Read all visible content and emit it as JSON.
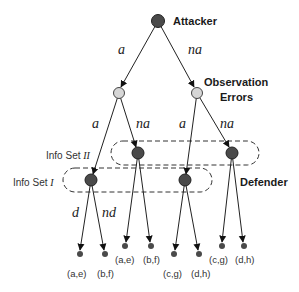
{
  "colors": {
    "player_node": "#4a4a4a",
    "chance_node": "#d6d6d6",
    "edge": "#222222",
    "text": "#1a1a1a"
  },
  "labels": {
    "attacker": "Attacker",
    "observation_errors_line1": "Observation",
    "observation_errors_line2": "Errors",
    "defender": "Defender",
    "info_set_2_prefix": "Info Set ",
    "info_set_2_roman": "II",
    "info_set_1_prefix": "Info Set ",
    "info_set_1_roman": "I"
  },
  "edges": {
    "root_left": "a",
    "root_right": "na",
    "left_chance_left": "a",
    "left_chance_right": "na",
    "right_chance_left": "a",
    "right_chance_right": "na",
    "defender_left": "d",
    "defender_right": "nd"
  },
  "nodes": {
    "root": {
      "x": 158,
      "y": 21,
      "type": "player"
    },
    "chance_left": {
      "x": 119,
      "y": 93,
      "type": "chance"
    },
    "chance_right": {
      "x": 197,
      "y": 93,
      "type": "chance"
    },
    "def_I_left": {
      "x": 91,
      "y": 180,
      "type": "player"
    },
    "def_I_right": {
      "x": 185,
      "y": 180,
      "type": "player"
    },
    "def_II_left": {
      "x": 138,
      "y": 153,
      "type": "player"
    },
    "def_II_right": {
      "x": 232,
      "y": 153,
      "type": "player"
    }
  },
  "leaves": [
    {
      "x": 80,
      "y": 254,
      "payoff": "(a,e)"
    },
    {
      "x": 105,
      "y": 254,
      "payoff": "(b,f)"
    },
    {
      "x": 125,
      "y": 246,
      "payoff": "(a,e)"
    },
    {
      "x": 151,
      "y": 246,
      "payoff": "(b,f)"
    },
    {
      "x": 174,
      "y": 254,
      "payoff": "(c,g)"
    },
    {
      "x": 199,
      "y": 254,
      "payoff": "(d,h)"
    },
    {
      "x": 222,
      "y": 246,
      "payoff": "(c,g)"
    },
    {
      "x": 244,
      "y": 246,
      "payoff": "(d,h)"
    }
  ]
}
